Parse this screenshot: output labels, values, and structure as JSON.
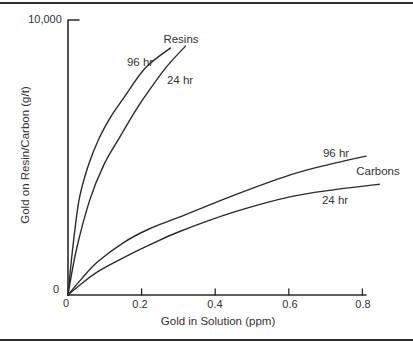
{
  "figure": {
    "background": "#ffffff",
    "rule_color": "#2e2e2e"
  },
  "chart_data": {
    "type": "line",
    "title": "",
    "xlabel": "Gold in Solution (ppm)",
    "ylabel": "Gold on Resin/Carbon (g/t)",
    "xlim": [
      0,
      0.85
    ],
    "ylim": [
      0,
      10000
    ],
    "grid": false,
    "legend": "inline-annotations",
    "line_color": "#2b2b2b",
    "axis_color": "#2b2b2b",
    "x_ticks": [
      {
        "value": 0,
        "label": "0"
      },
      {
        "value": 0.2,
        "label": "0.2"
      },
      {
        "value": 0.4,
        "label": "0.4"
      },
      {
        "value": 0.6,
        "label": "0.6"
      },
      {
        "value": 0.8,
        "label": "0.8"
      }
    ],
    "y_ticks": [
      {
        "value": 0,
        "label": "0"
      },
      {
        "value": 10000,
        "label": "10,000"
      }
    ],
    "series": [
      {
        "name": "resins-96hr",
        "group": "Resins",
        "label": "96 hr",
        "points": [
          [
            0,
            0
          ],
          [
            0.012,
            1600
          ],
          [
            0.03,
            3450
          ],
          [
            0.055,
            4700
          ],
          [
            0.084,
            5680
          ],
          [
            0.115,
            6450
          ],
          [
            0.15,
            7140
          ],
          [
            0.21,
            8250
          ],
          [
            0.278,
            8980
          ]
        ]
      },
      {
        "name": "resins-24hr",
        "group": "Resins",
        "label": "24 hr",
        "points": [
          [
            0,
            0
          ],
          [
            0.022,
            1600
          ],
          [
            0.059,
            3450
          ],
          [
            0.098,
            4750
          ],
          [
            0.138,
            5680
          ],
          [
            0.172,
            6450
          ],
          [
            0.205,
            7140
          ],
          [
            0.265,
            8250
          ],
          [
            0.319,
            9050
          ]
        ]
      },
      {
        "name": "carbons-96hr",
        "group": "Carbons",
        "label": "96 hr",
        "points": [
          [
            0,
            0
          ],
          [
            0.035,
            560
          ],
          [
            0.08,
            1200
          ],
          [
            0.15,
            1900
          ],
          [
            0.22,
            2400
          ],
          [
            0.3,
            2820
          ],
          [
            0.45,
            3620
          ],
          [
            0.6,
            4350
          ],
          [
            0.71,
            4750
          ],
          [
            0.81,
            5050
          ]
        ]
      },
      {
        "name": "carbons-24hr",
        "group": "Carbons",
        "label": "24 hr",
        "points": [
          [
            0,
            0
          ],
          [
            0.035,
            390
          ],
          [
            0.08,
            840
          ],
          [
            0.15,
            1350
          ],
          [
            0.22,
            1810
          ],
          [
            0.3,
            2290
          ],
          [
            0.45,
            3010
          ],
          [
            0.6,
            3560
          ],
          [
            0.73,
            3840
          ],
          [
            0.846,
            4030
          ]
        ]
      }
    ],
    "annotations": [
      {
        "text": "Resins",
        "for": "resins-group"
      },
      {
        "text": "96 hr",
        "for": "resins-96hr"
      },
      {
        "text": "24 hr",
        "for": "resins-24hr"
      },
      {
        "text": "96 hr",
        "for": "carbons-96hr"
      },
      {
        "text": "Carbons",
        "for": "carbons-group"
      },
      {
        "text": "24 hr",
        "for": "carbons-24hr"
      }
    ]
  }
}
